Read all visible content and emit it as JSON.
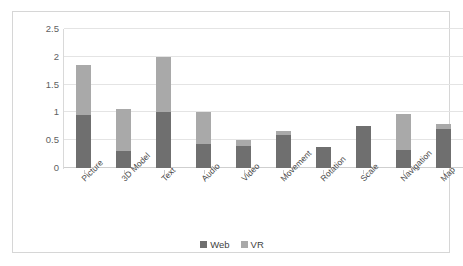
{
  "chart_data": {
    "type": "bar",
    "stacked": true,
    "title": "",
    "xlabel": "",
    "ylabel": "",
    "ylim": [
      0,
      2.5
    ],
    "ytick_labels": [
      "0",
      "0.5",
      "1",
      "1.5",
      "2",
      "2.5"
    ],
    "ytick_values": [
      0,
      0.5,
      1,
      1.5,
      2,
      2.5
    ],
    "grid": true,
    "legend_position": "bottom",
    "categories": [
      "Picture",
      "3D Model",
      "Text",
      "Audio",
      "Video",
      "Movement",
      "Rotation",
      "Scale",
      "Navigation",
      "Map"
    ],
    "series": [
      {
        "name": "Web",
        "color": "#6f6f6f",
        "values": [
          0.95,
          0.3,
          1.0,
          0.43,
          0.4,
          0.6,
          0.37,
          0.75,
          0.32,
          0.7
        ]
      },
      {
        "name": "VR",
        "color": "#a9a9a9",
        "values": [
          0.9,
          0.77,
          1.0,
          0.57,
          0.1,
          0.07,
          0.0,
          0.0,
          0.65,
          0.1
        ]
      }
    ],
    "totals": [
      1.85,
      1.07,
      2.0,
      1.0,
      0.5,
      0.67,
      0.37,
      0.75,
      0.97,
      0.8
    ]
  },
  "legend": {
    "items": [
      {
        "label": "Web",
        "color": "#6f6f6f"
      },
      {
        "label": "VR",
        "color": "#a9a9a9"
      }
    ]
  },
  "colors": {
    "web": "#6f6f6f",
    "vr": "#a9a9a9",
    "gridline": "#e4e4e4",
    "frame_border": "#d6d6d6",
    "axis_text": "#5f5f5f",
    "background": "#ffffff"
  }
}
